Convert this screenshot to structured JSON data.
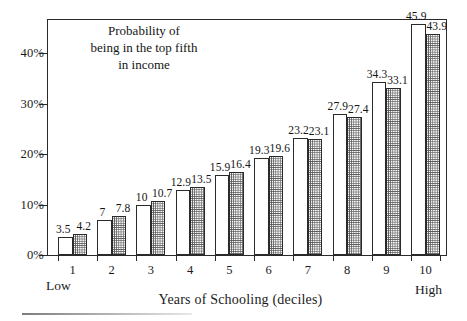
{
  "chart_data": {
    "type": "bar",
    "title": "",
    "annotation": [
      "Probability of",
      "being in the top fifth",
      "in income"
    ],
    "xlabel": "Years of Schooling (deciles)",
    "ylabel": "",
    "categories": [
      "1",
      "2",
      "3",
      "4",
      "5",
      "6",
      "7",
      "8",
      "9",
      "10"
    ],
    "x_axis_end_labels": {
      "left": "Low",
      "right": "High"
    },
    "ylim": [
      0,
      47
    ],
    "y_ticks": [
      0,
      10,
      20,
      30,
      40
    ],
    "y_tick_labels": [
      "0%",
      "10%",
      "20%",
      "30%",
      "40%"
    ],
    "grid": false,
    "legend_position": "none",
    "series": [
      {
        "name": "series-1-plain",
        "fill": "white",
        "values": [
          3.5,
          7,
          10,
          12.9,
          15.9,
          19.3,
          23.2,
          27.9,
          34.3,
          45.9
        ],
        "labels": [
          "3.5",
          "7",
          "10",
          "12.9",
          "15.9",
          "19.3",
          "23.2",
          "27.9",
          "34.3",
          "45.9"
        ]
      },
      {
        "name": "series-2-stippled",
        "fill": "stipple",
        "values": [
          4.2,
          7.8,
          10.7,
          13.5,
          16.4,
          19.6,
          23.1,
          27.4,
          33.1,
          43.9
        ],
        "labels": [
          "4.2",
          "7.8",
          "10.7",
          "13.5",
          "16.4",
          "19.6",
          "23.1",
          "27.4",
          "33.1",
          "43.9"
        ]
      }
    ],
    "colors": {
      "axis": "#2a2a2a",
      "bar_plain_fill": "#ffffff",
      "bar_stipple_ink": "#5c5c5c",
      "text": "#141414"
    }
  }
}
